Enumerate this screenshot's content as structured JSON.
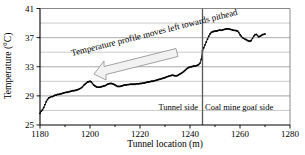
{
  "chart_data": {
    "type": "line",
    "title": "",
    "xlabel": "Tunnel location (m)",
    "ylabel": "Temperature (°C)",
    "xlim": [
      1180,
      1280
    ],
    "ylim": [
      25,
      41
    ],
    "xticks": [
      1180,
      1200,
      1220,
      1240,
      1260,
      1280
    ],
    "xtick_labels": [
      "1180",
      "1200",
      "1220",
      "1240",
      "1260",
      "1280"
    ],
    "yticks": [
      25,
      29,
      33,
      37,
      41
    ],
    "ytick_labels": [
      "25",
      "29",
      "33",
      "37",
      "41"
    ],
    "gridlines_y": [
      27,
      29,
      31,
      33,
      35,
      37,
      39
    ],
    "grid": true,
    "legend": "none",
    "minor_xticks": [
      1190,
      1210,
      1230,
      1250,
      1270
    ],
    "marker": "filled-circle",
    "series": [
      {
        "name": "Temperature profile",
        "x": [
          1180.0,
          1180.5,
          1181.0,
          1181.5,
          1182.0,
          1182.5,
          1183.0,
          1183.5,
          1184.0,
          1184.5,
          1185.0,
          1185.5,
          1186.0,
          1186.5,
          1187.0,
          1187.5,
          1188.0,
          1188.5,
          1189.0,
          1189.5,
          1190.0,
          1190.5,
          1191.0,
          1191.5,
          1192.0,
          1192.5,
          1193.0,
          1193.5,
          1194.0,
          1194.5,
          1195.0,
          1195.5,
          1196.0,
          1196.5,
          1197.0,
          1197.5,
          1198.0,
          1198.5,
          1199.0,
          1199.5,
          1200.0,
          1200.5,
          1201.0,
          1201.5,
          1202.0,
          1202.5,
          1203.0,
          1203.5,
          1204.0,
          1204.5,
          1205.0,
          1205.5,
          1206.0,
          1206.5,
          1207.0,
          1207.5,
          1208.0,
          1208.5,
          1209.0,
          1209.5,
          1210.0,
          1210.5,
          1211.0,
          1211.5,
          1212.0,
          1212.5,
          1213.0,
          1213.5,
          1214.0,
          1214.5,
          1215.0,
          1215.5,
          1216.0,
          1216.5,
          1217.0,
          1217.5,
          1218.0,
          1218.5,
          1219.0,
          1219.5,
          1220.0,
          1220.5,
          1221.0,
          1221.5,
          1222.0,
          1222.5,
          1223.0,
          1223.5,
          1224.0,
          1224.5,
          1225.0,
          1225.5,
          1226.0,
          1226.5,
          1227.0,
          1227.5,
          1228.0,
          1228.5,
          1229.0,
          1229.5,
          1230.0,
          1230.5,
          1231.0,
          1231.5,
          1232.0,
          1232.5,
          1233.0,
          1233.5,
          1234.0,
          1234.5,
          1235.0,
          1235.5,
          1236.0,
          1236.5,
          1237.0,
          1237.5,
          1238.0,
          1238.5,
          1239.0,
          1239.5,
          1240.0,
          1240.5,
          1241.0,
          1241.5,
          1242.0,
          1242.5,
          1243.0,
          1243.5,
          1244.0,
          1244.5,
          1245.0,
          1245.5,
          1246.0,
          1246.5,
          1247.0,
          1247.5,
          1248.0,
          1248.5,
          1249.0,
          1249.5,
          1250.0,
          1250.5,
          1251.0,
          1251.5,
          1252.0,
          1252.5,
          1253.0,
          1253.5,
          1254.0,
          1254.5,
          1255.0,
          1255.5,
          1256.0,
          1256.5,
          1257.0,
          1257.5,
          1258.0,
          1258.5,
          1259.0,
          1259.5,
          1260.0,
          1260.5,
          1261.0,
          1261.5,
          1262.0,
          1262.5,
          1263.0,
          1263.5,
          1264.0,
          1264.5,
          1265.0,
          1265.5,
          1266.0,
          1266.5,
          1267.0,
          1267.5,
          1268.0,
          1268.5,
          1269.0,
          1269.5,
          1270.0
        ],
        "y": [
          26.6,
          26.9,
          27.1,
          27.4,
          27.8,
          28.2,
          28.5,
          28.7,
          28.8,
          28.9,
          28.9,
          29.0,
          29.1,
          29.1,
          29.2,
          29.2,
          29.25,
          29.3,
          29.35,
          29.4,
          29.45,
          29.5,
          29.5,
          29.55,
          29.6,
          29.65,
          29.7,
          29.7,
          29.75,
          29.8,
          29.85,
          29.9,
          30.0,
          30.1,
          30.25,
          30.45,
          30.6,
          30.75,
          30.9,
          30.95,
          31.0,
          30.9,
          30.7,
          30.5,
          30.35,
          30.25,
          30.2,
          30.2,
          30.2,
          30.25,
          30.3,
          30.35,
          30.4,
          30.5,
          30.6,
          30.65,
          30.7,
          30.7,
          30.65,
          30.6,
          30.5,
          30.4,
          30.3,
          30.3,
          30.3,
          30.35,
          30.4,
          30.45,
          30.5,
          30.5,
          30.55,
          30.55,
          30.6,
          30.6,
          30.6,
          30.6,
          30.6,
          30.65,
          30.65,
          30.65,
          30.7,
          30.7,
          30.75,
          30.75,
          30.8,
          30.85,
          30.9,
          30.9,
          30.95,
          31.0,
          31.0,
          31.05,
          31.1,
          31.15,
          31.2,
          31.25,
          31.3,
          31.35,
          31.4,
          31.45,
          31.5,
          31.6,
          31.65,
          31.7,
          31.75,
          31.8,
          31.85,
          31.8,
          31.75,
          31.75,
          31.8,
          31.9,
          32.0,
          32.1,
          32.2,
          32.35,
          32.5,
          32.65,
          32.8,
          32.9,
          32.95,
          33.0,
          33.05,
          33.1,
          33.1,
          33.15,
          33.2,
          33.3,
          33.5,
          34.0,
          35.2,
          35.6,
          36.0,
          36.4,
          36.8,
          37.2,
          37.5,
          37.7,
          37.8,
          37.85,
          37.9,
          37.9,
          37.95,
          38.0,
          38.05,
          38.0,
          38.05,
          38.1,
          38.15,
          38.2,
          38.2,
          38.2,
          38.15,
          38.1,
          38.05,
          38.0,
          38.0,
          37.95,
          37.9,
          37.7,
          37.4,
          37.2,
          37.0,
          36.9,
          36.8,
          36.7,
          36.6,
          36.55,
          36.5,
          36.6,
          36.9,
          37.2,
          37.4,
          37.45,
          37.3,
          37.1,
          37.2,
          37.3,
          37.4,
          37.45,
          37.5
        ]
      }
    ],
    "annotations": [
      {
        "name": "profile-direction-annotation",
        "text": "Temperature profile moves left towards pithead",
        "arrow_direction": "left"
      },
      {
        "name": "tunnel-side-label",
        "text": "Tunnel side"
      },
      {
        "name": "goaf-side-label",
        "text": "Coal mine goaf side"
      }
    ],
    "divider": {
      "x": 1245,
      "label_left": "Tunnel side",
      "label_right": "Coal mine goaf side",
      "color": "#595959"
    },
    "colors": {
      "series": "#000000",
      "grid": "#a6a6a6",
      "frame": "#808080",
      "arrow_fill": "#f2f2f2",
      "arrow_stroke": "#8c8c8c",
      "background": "#ffffff"
    }
  }
}
